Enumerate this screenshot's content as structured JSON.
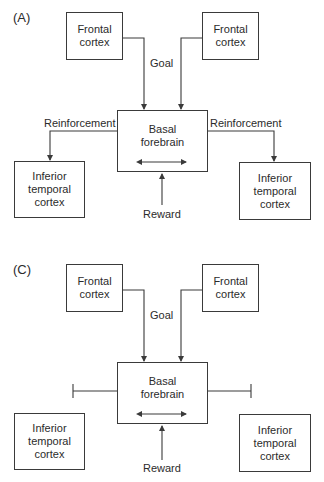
{
  "panels": {
    "a": {
      "label": "(A)",
      "frontal_left": {
        "line1": "Frontal",
        "line2": "cortex"
      },
      "frontal_right": {
        "line1": "Frontal",
        "line2": "cortex"
      },
      "goal": "Goal",
      "basal": {
        "line1": "Basal",
        "line2": "forebrain"
      },
      "reinforcement_left": "Reinforcement",
      "reinforcement_right": "Reinforcement",
      "inferior_left": {
        "line1": "Inferior",
        "line2": "temporal",
        "line3": "cortex"
      },
      "inferior_right": {
        "line1": "Inferior",
        "line2": "temporal",
        "line3": "cortex"
      },
      "reward": "Reward"
    },
    "c": {
      "label": "(C)",
      "frontal_left": {
        "line1": "Frontal",
        "line2": "cortex"
      },
      "frontal_right": {
        "line1": "Frontal",
        "line2": "cortex"
      },
      "goal": "Goal",
      "basal": {
        "line1": "Basal",
        "line2": "forebrain"
      },
      "inferior_left": {
        "line1": "Inferior",
        "line2": "temporal",
        "line3": "cortex"
      },
      "inferior_right": {
        "line1": "Inferior",
        "line2": "temporal",
        "line3": "cortex"
      },
      "reward": "Reward"
    }
  },
  "colors": {
    "stroke": "#3a3a3a",
    "text": "#2b2b2b",
    "background": "#ffffff"
  }
}
